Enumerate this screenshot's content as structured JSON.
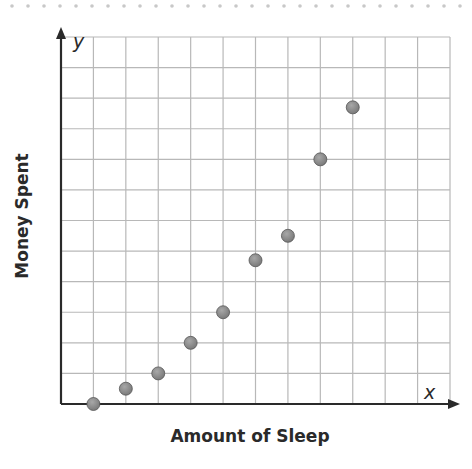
{
  "chart_data": {
    "type": "scatter",
    "title": "",
    "xlabel": "Amount of Sleep",
    "ylabel": "Money Spent",
    "x_axis_letter": "x",
    "y_axis_letter": "y",
    "grid": true,
    "xlim": [
      0,
      12
    ],
    "ylim": [
      0,
      12
    ],
    "tick_labels": "none",
    "legend": "none",
    "series": [
      {
        "name": "data",
        "x": [
          1,
          2,
          3,
          4,
          5,
          6,
          7,
          8,
          9
        ],
        "y": [
          0,
          0.5,
          1,
          2,
          3,
          4.7,
          5.5,
          8,
          9.7
        ]
      }
    ]
  },
  "colors": {
    "axis": "#2a2a2a",
    "grid": "#b8b8b8",
    "point": "#7a7a7a",
    "point_stroke": "#555555",
    "dotted_border": "#c8c8c8"
  }
}
